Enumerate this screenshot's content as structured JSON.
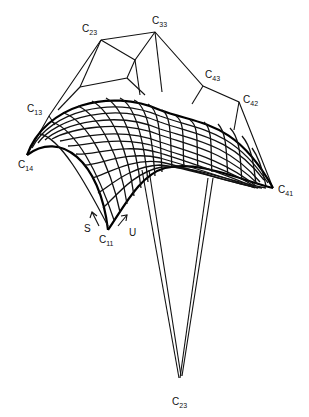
{
  "figure": {
    "type": "bicubic-surface-with-control-net",
    "labels": [
      {
        "id": "c23-top",
        "base": "C",
        "sub": "23",
        "x": 82,
        "y": 32
      },
      {
        "id": "c33",
        "base": "C",
        "sub": "33",
        "x": 152,
        "y": 24
      },
      {
        "id": "c43",
        "base": "C",
        "sub": "43",
        "x": 205,
        "y": 78
      },
      {
        "id": "c42",
        "base": "C",
        "sub": "42",
        "x": 243,
        "y": 103
      },
      {
        "id": "c13",
        "base": "C",
        "sub": "13",
        "x": 27,
        "y": 112
      },
      {
        "id": "c14",
        "base": "C",
        "sub": "14",
        "x": 18,
        "y": 168
      },
      {
        "id": "c41",
        "base": "C",
        "sub": "41",
        "x": 278,
        "y": 193
      },
      {
        "id": "c11",
        "base": "C",
        "sub": "11",
        "x": 99,
        "y": 243
      },
      {
        "id": "c23-bottom",
        "base": "C",
        "sub": "23",
        "x": 172,
        "y": 405
      }
    ],
    "axes": [
      {
        "name": "S",
        "x": 84,
        "y": 232
      },
      {
        "name": "U",
        "x": 129,
        "y": 236
      }
    ],
    "control_points": {
      "C23_top": [
        101,
        40
      ],
      "C33": [
        155,
        32
      ],
      "C43": [
        203,
        86
      ],
      "C42": [
        239,
        102
      ],
      "C13": [
        49,
        116
      ],
      "C14": [
        27,
        155
      ],
      "C41": [
        273,
        188
      ],
      "C11": [
        108,
        230
      ],
      "C23_bottom": [
        179,
        378
      ],
      "inner_a": [
        135,
        60
      ],
      "inner_b": [
        127,
        78
      ],
      "inner_c": [
        80,
        87
      ]
    },
    "colors": {
      "ink": "#111111",
      "background": "#ffffff"
    }
  }
}
